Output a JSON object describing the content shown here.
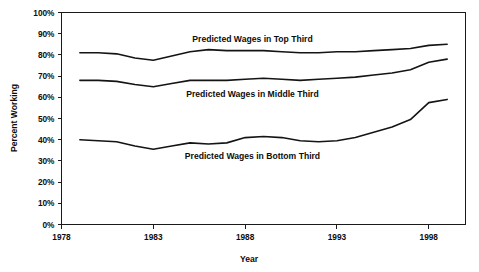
{
  "chart_data": {
    "type": "line",
    "title": "",
    "xlabel": "Year",
    "ylabel": "Percent Working",
    "xlim": [
      1978,
      2000
    ],
    "ylim": [
      0,
      100
    ],
    "grid": false,
    "legend_position": "inline-annotations",
    "x_tick_labels": [
      "1978",
      "1983",
      "1988",
      "1993",
      "1998"
    ],
    "x_ticks": [
      1978,
      1983,
      1988,
      1993,
      1998
    ],
    "y_tick_labels": [
      "0%",
      "10%",
      "20%",
      "30%",
      "40%",
      "50%",
      "60%",
      "70%",
      "80%",
      "90%",
      "100%"
    ],
    "y_ticks": [
      0,
      10,
      20,
      30,
      40,
      50,
      60,
      70,
      80,
      90,
      100
    ],
    "x": [
      1979,
      1980,
      1981,
      1982,
      1983,
      1984,
      1985,
      1986,
      1987,
      1988,
      1989,
      1990,
      1991,
      1992,
      1993,
      1994,
      1995,
      1996,
      1997,
      1998,
      1999
    ],
    "series": [
      {
        "name": "Predicted Wages in Top Third",
        "label": "Predicted Wages in Top Third",
        "values": [
          81,
          81,
          80.5,
          78.5,
          77.5,
          79.5,
          81.5,
          82.5,
          82,
          82,
          82,
          81.5,
          81,
          81,
          81.5,
          81.5,
          82,
          82.5,
          83,
          84.5,
          85
        ]
      },
      {
        "name": "Predicted Wages in Middle Third",
        "label": "Predicted Wages in Middle Third",
        "values": [
          68,
          68,
          67.5,
          66,
          65,
          66.5,
          68,
          68,
          68,
          68.5,
          69,
          68.5,
          68,
          68.5,
          69,
          69.5,
          70.5,
          71.5,
          73,
          76.5,
          78
        ]
      },
      {
        "name": "Predicted Wages in Bottom Third",
        "label": "Predicted Wages in Bottom Third",
        "values": [
          40,
          39.5,
          39,
          37,
          35.5,
          37,
          38.5,
          38,
          38.5,
          41,
          41.5,
          41,
          39.5,
          39,
          39.5,
          41,
          43.5,
          46,
          49.5,
          57.5,
          59
        ]
      }
    ],
    "annotations": [
      {
        "text": "Predicted Wages in Top Third",
        "x": 1988.4,
        "y": 87.5
      },
      {
        "text": "Predicted Wages in Middle Third",
        "x": 1988.4,
        "y": 61.5
      },
      {
        "text": "Predicted Wages in Bottom Third",
        "x": 1988.4,
        "y": 32.5
      },
      {
        "text": "Percent Working",
        "x": 0,
        "y": 50
      },
      {
        "text": "Year",
        "x": 1988.5,
        "y": 0
      }
    ]
  },
  "colors": {
    "line": "#141414",
    "axis": "#1a1a1a",
    "text": "#0d0d0d",
    "background": "#ffffff"
  }
}
